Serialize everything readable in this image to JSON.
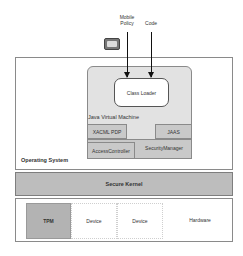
{
  "inputs": {
    "mobile_policy": "Mobile\nPolicy",
    "mobile_policy_line1": "Mobile",
    "mobile_policy_line2": "Policy",
    "code": "Code"
  },
  "icons": {
    "device": "mobile-device-icon"
  },
  "operating_system": {
    "label": "Operating System",
    "jvm": {
      "label": "Java Virtual Machine",
      "class_loader": "Class Loader",
      "components": {
        "xacml_pdp": "XACML PDP",
        "jaas": "JAAS",
        "access_controller": "AccessController",
        "security_manager": "SecurityManager"
      }
    }
  },
  "secure_kernel": {
    "label": "Secure Kernel"
  },
  "hardware": {
    "label": "Hardware",
    "items": [
      "TPM",
      "Device",
      "Device"
    ]
  },
  "colors": {
    "kernel_fill": "#bdbdbd",
    "tpm_fill": "#b3b3b3",
    "component_fill": "#c9c9c9",
    "jvm_fill": "#e2e2e2"
  }
}
